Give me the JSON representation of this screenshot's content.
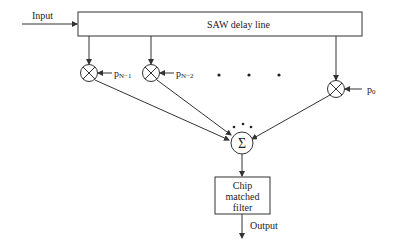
{
  "diagram": {
    "input_label": "Input",
    "delay_line_label": "SAW delay line",
    "taps": [
      {
        "label": "p",
        "sub": "N−1"
      },
      {
        "label": "p",
        "sub": "N−2"
      },
      {
        "label": "p",
        "sub": "0"
      }
    ],
    "summer_symbol": "Σ",
    "multiplier_symbol": "⊗",
    "filter_lines": [
      "Chip",
      "matched",
      "filter"
    ],
    "output_label": "Output",
    "colors": {
      "stroke": "#333333",
      "text": "#222222",
      "background": "#ffffff"
    }
  }
}
